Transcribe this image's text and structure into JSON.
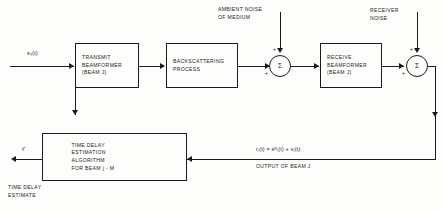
{
  "figure": {
    "type": "block-diagram",
    "domain": "sonar-signal-processing"
  },
  "blocks": {
    "transmit_beamformer": {
      "line1": "TRANSMIT",
      "line2": "BEAMFORMER",
      "line3": "(BEAM J)"
    },
    "backscattering": {
      "line1": "BACKSCATTERING",
      "line2": "PROCESS"
    },
    "receive_beamformer": {
      "line1": "RECEIVE",
      "line2": "BEAMFORMER",
      "line3": "(BEAM J)"
    },
    "time_delay_estimator": {
      "line1": "TIME DELAY",
      "line2": "ESTIMATION",
      "line3": "ALGORITHM",
      "line4": "FOR BEAM j - M"
    }
  },
  "summers": {
    "medium": {
      "glyph": "Σ",
      "sign_top": "+",
      "sign_left": "+"
    },
    "receiver": {
      "glyph": "Σ",
      "sign_top": "+",
      "sign_left": "+"
    }
  },
  "labels": {
    "ambient_noise_l1": "AMBIENT NOISE",
    "ambient_noise_l2": "OF MEDIUM",
    "receiver_noise_l1": "RECEIVER",
    "receiver_noise_l2": "NOISE",
    "time_delay_estimate_l1": "TIME DELAY",
    "time_delay_estimate_l2": "ESTIMATE",
    "output_of_beam": "OUTPUT OF BEAM J"
  },
  "signals": {
    "transmit_signal": "s",
    "transmit_signal_sub": "T",
    "transmit_signal_arg": "(t)",
    "beam_output_equation": "rⱼ(t) = sᴿⱼ(t) + vⱼ(t)",
    "tau_hat": "τ̂"
  },
  "colors": {
    "ink": "#1a1a1a",
    "paper": "#fdfdfc"
  }
}
